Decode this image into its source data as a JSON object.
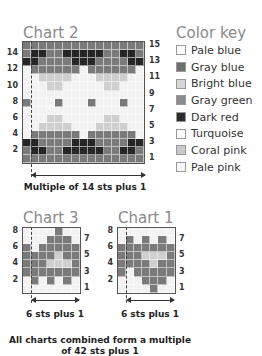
{
  "chart2": {
    "title": "Chart 2",
    "caption": "Multiple of 14 sts plus 1",
    "left_row_numbers": [
      "14",
      "12",
      "10",
      "8",
      "6",
      "4",
      "2"
    ],
    "right_row_numbers": [
      "15",
      "13",
      "11",
      "9",
      "7",
      "5",
      "3",
      "1"
    ],
    "columns": 15,
    "rows_top_to_bottom": [
      "GGGGGGGGGGGGGGG",
      "GDDGGDDDDDGGDDG",
      "DDGGGGDDDGGGGDD",
      "PGGGGGGPGGGGGGP",
      "PPBBBBPPPBBBBPP",
      "PPPBBPPPPPBBPPP",
      "PPPPPPPPPPPPPPP",
      "GPPPGPPPGPPPGPP",
      "PPPPPPPPPPPPPPP",
      "PPPBBPPPPPBBPPP",
      "PPBBBBPPPBBBBPP",
      "PGGGGGGPGGGGGGP",
      "DDGGGGDDDGGGGDD",
      "GDDGGDDDDDGGDDG",
      "GGGGGGGGGGGGGGG"
    ]
  },
  "chart3": {
    "title": "Chart 3",
    "caption": "6 sts plus 1",
    "left_row_numbers": [
      "8",
      "6",
      "4",
      "2"
    ],
    "right_row_numbers": [
      "7",
      "5",
      "3",
      "1"
    ],
    "columns": 7,
    "rows_top_to_bottom": [
      "PPPPGPP",
      "PPPGGGP",
      "GPGGGGG",
      "GGGGBGG",
      "GGGBBBG",
      "GGGGGGG",
      "PGPGPGP",
      "PPPPPPP"
    ]
  },
  "chart1": {
    "title": "Chart 1",
    "caption": "6 sts plus 1",
    "left_row_numbers": [
      "8",
      "6",
      "4",
      "2"
    ],
    "right_row_numbers": [
      "7",
      "5",
      "3",
      "1"
    ],
    "columns": 7,
    "rows_top_to_bottom": [
      "PPPPPPP",
      "PGPGPGP",
      "GGGGGGG",
      "GGGBBBG",
      "GGGGBGG",
      "GPGGGGG",
      "PPPGGGP",
      "PPPPGPP"
    ]
  },
  "footer": {
    "line1": "All charts combined form a multiple",
    "line2": "of 42 sts plus 1"
  },
  "color_key": {
    "title": "Color key",
    "items": [
      {
        "label": "Pale blue",
        "color": "#ffffff"
      },
      {
        "label": "Gray blue",
        "color": "#6f6f6f"
      },
      {
        "label": "Bright blue",
        "color": "#d6d6d6"
      },
      {
        "label": "Gray green",
        "color": "#8c8c8c"
      },
      {
        "label": "Dark red",
        "color": "#2b2b2b"
      },
      {
        "label": "Turquoise",
        "color": "#fbfbfb"
      },
      {
        "label": "Coral pink",
        "color": "#c9c9c9"
      },
      {
        "label": "Pale pink",
        "color": "#f6f6f6"
      }
    ]
  },
  "cell_colors": {
    "G": "#7a7a7a",
    "D": "#262626",
    "P": "#f2f2f2",
    "B": "#cfcfcf"
  }
}
